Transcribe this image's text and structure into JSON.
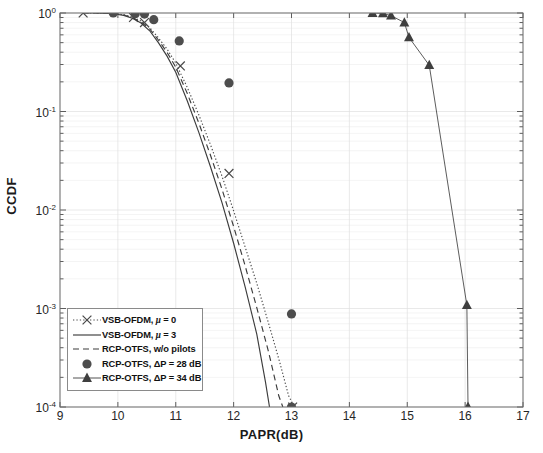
{
  "chart_data": {
    "type": "line",
    "title": "",
    "xlabel": "PAPR(dB)",
    "ylabel": "CCDF",
    "xlim": [
      9,
      17
    ],
    "ylim": [
      0.0001,
      1
    ],
    "yscale": "log",
    "grid": true,
    "legend_position": "lower-left",
    "xticks": [
      "9",
      "10",
      "11",
      "12",
      "13",
      "14",
      "15",
      "16",
      "17"
    ],
    "yticks": [
      "10^0",
      "10^-1",
      "10^-2",
      "10^-3",
      "10^-4"
    ],
    "ytick_labels": [
      {
        "mantissa": "10",
        "exp": "0"
      },
      {
        "mantissa": "10",
        "exp": "-1"
      },
      {
        "mantissa": "10",
        "exp": "-2"
      },
      {
        "mantissa": "10",
        "exp": "-3"
      },
      {
        "mantissa": "10",
        "exp": "-4"
      }
    ],
    "series": [
      {
        "name": "VSB-OFDM, mu = 0",
        "legend_label": "VSB-OFDM, μ = 0",
        "style": "dotted",
        "marker": "x",
        "color": "#4a4a4a",
        "x": [
          9.4,
          9.6,
          9.8,
          9.95,
          10.1,
          10.25,
          10.4,
          10.55,
          10.7,
          10.85,
          11.0,
          11.2,
          11.4,
          11.6,
          11.8,
          12.0,
          12.2,
          12.4,
          12.6,
          12.8,
          12.95,
          13.05
        ],
        "y": [
          1.0,
          1.0,
          0.995,
          0.985,
          0.96,
          0.91,
          0.83,
          0.71,
          0.56,
          0.43,
          0.31,
          0.175,
          0.092,
          0.046,
          0.022,
          0.0098,
          0.0042,
          0.0018,
          0.00072,
          0.00028,
          0.00013,
          0.0001
        ],
        "marker_x": [
          9.4,
          10.27,
          10.46,
          11.08,
          11.92,
          13.02
        ],
        "marker_y": [
          1.0,
          0.9,
          0.8,
          0.29,
          0.0235,
          0.0001
        ]
      },
      {
        "name": "VSB-OFDM, mu = 3",
        "legend_label": "VSB-OFDM, μ = 3",
        "style": "solid",
        "marker": "none",
        "color": "#3c3c3c",
        "x": [
          9.4,
          9.6,
          9.8,
          9.95,
          10.1,
          10.25,
          10.4,
          10.55,
          10.7,
          10.85,
          11.0,
          11.2,
          11.4,
          11.6,
          11.8,
          12.0,
          12.2,
          12.4,
          12.55,
          12.62
        ],
        "y": [
          1.0,
          1.0,
          0.993,
          0.978,
          0.945,
          0.885,
          0.79,
          0.66,
          0.5,
          0.365,
          0.25,
          0.128,
          0.061,
          0.0275,
          0.0118,
          0.0046,
          0.00165,
          0.00055,
          0.00018,
          0.0001
        ]
      },
      {
        "name": "RCP-OTFS, w/o pilots",
        "legend_label": "RCP-OTFS, w/o pilots",
        "style": "dashed",
        "marker": "none",
        "color": "#3c3c3c",
        "x": [
          9.4,
          9.6,
          9.8,
          9.95,
          10.1,
          10.25,
          10.4,
          10.55,
          10.7,
          10.85,
          11.0,
          11.2,
          11.4,
          11.6,
          11.8,
          12.0,
          12.2,
          12.4,
          12.6,
          12.78,
          12.85
        ],
        "y": [
          1.0,
          1.0,
          0.994,
          0.982,
          0.953,
          0.898,
          0.812,
          0.688,
          0.532,
          0.398,
          0.282,
          0.152,
          0.076,
          0.036,
          0.0162,
          0.0068,
          0.0027,
          0.00102,
          0.00037,
          0.00013,
          0.0001
        ]
      },
      {
        "name": "RCP-OTFS, Delta P = 28 dB",
        "legend_label": "RCP-OTFS, ΔP = 28 dB",
        "style": "none",
        "marker": "circle",
        "color": "#4d4d4d",
        "x": [
          9.92,
          10.3,
          10.46,
          10.62,
          11.06,
          11.92,
          13.0,
          13.0
        ],
        "y": [
          1.0,
          0.985,
          0.975,
          0.855,
          0.52,
          0.195,
          0.00088,
          0.0001
        ]
      },
      {
        "name": "RCP-OTFS, Delta P = 34 dB",
        "legend_label": "RCP-OTFS, ΔP = 34 dB",
        "style": "solid-thin",
        "marker": "triangle",
        "color": "#3f3f3f",
        "x": [
          14.4,
          14.58,
          14.72,
          14.95,
          15.03,
          15.38,
          16.03,
          16.05
        ],
        "y": [
          1.0,
          0.99,
          0.94,
          0.8,
          0.565,
          0.295,
          0.00108,
          0.0001
        ]
      }
    ]
  },
  "axis": {
    "xlabel": "PAPR(dB)",
    "ylabel": "CCDF"
  }
}
